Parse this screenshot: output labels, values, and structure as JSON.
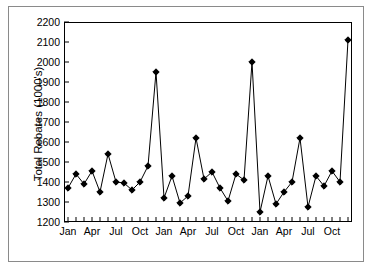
{
  "chart_data": {
    "type": "line",
    "title": "",
    "xlabel": "Month",
    "ylabel": "Total Rebates (1000's)",
    "ylim": [
      1200,
      2200
    ],
    "ytick_values": [
      1200,
      1300,
      1400,
      1500,
      1600,
      1700,
      1800,
      1900,
      2000,
      2100,
      2200
    ],
    "ytick_labels": [
      "1200",
      "1300",
      "1400",
      "1500",
      "1600",
      "1700",
      "1800",
      "1900",
      "2000",
      "2100",
      "2200"
    ],
    "grid": false,
    "legend": false,
    "marker": "diamond",
    "marker_color": "#000000",
    "line_color": "#000000",
    "x_minor_ticks": 36,
    "x_labeled_ticks": [
      {
        "index": 0,
        "label": "Jan"
      },
      {
        "index": 3,
        "label": "Apr"
      },
      {
        "index": 6,
        "label": "Jul"
      },
      {
        "index": 9,
        "label": "Oct"
      },
      {
        "index": 12,
        "label": "Jan"
      },
      {
        "index": 15,
        "label": "Apr"
      },
      {
        "index": 18,
        "label": "Jul"
      },
      {
        "index": 21,
        "label": "Oct"
      },
      {
        "index": 24,
        "label": "Jan"
      },
      {
        "index": 27,
        "label": "Apr"
      },
      {
        "index": 30,
        "label": "Jul"
      },
      {
        "index": 33,
        "label": "Oct"
      }
    ],
    "categories": [
      "Jan",
      "Feb",
      "Mar",
      "Apr",
      "May",
      "Jun",
      "Jul",
      "Aug",
      "Sep",
      "Oct",
      "Nov",
      "Dec",
      "Jan",
      "Feb",
      "Mar",
      "Apr",
      "May",
      "Jun",
      "Jul",
      "Aug",
      "Sep",
      "Oct",
      "Nov",
      "Dec",
      "Jan",
      "Feb",
      "Mar",
      "Apr",
      "May",
      "Jun",
      "Jul",
      "Aug",
      "Sep",
      "Oct",
      "Nov",
      "Dec"
    ],
    "values": [
      1370,
      1440,
      1390,
      1455,
      1350,
      1540,
      1400,
      1395,
      1360,
      1400,
      1480,
      1950,
      1320,
      1430,
      1295,
      1330,
      1620,
      1415,
      1450,
      1370,
      1305,
      1440,
      1410,
      2000,
      1250,
      1430,
      1290,
      1350,
      1400,
      1620,
      1275,
      1430,
      1380,
      1455,
      1400,
      2110
    ]
  }
}
